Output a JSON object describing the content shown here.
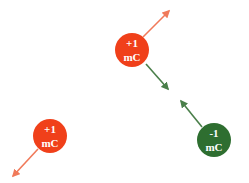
{
  "colors": {
    "positive_fill": "#F0401A",
    "negative_fill": "#2E6E30",
    "positive_arrow": "#F07A5A",
    "negative_arrow": "#4A7F4A",
    "background": "#FFFFFF"
  },
  "charges": [
    {
      "id": "charge-top",
      "sign": "positive",
      "value": "+1",
      "unit": "mC",
      "cx": 132,
      "cy": 50,
      "r": 17
    },
    {
      "id": "charge-bottom-left",
      "sign": "positive",
      "value": "+1",
      "unit": "mC",
      "cx": 50,
      "cy": 136,
      "r": 17
    },
    {
      "id": "charge-bottom-right",
      "sign": "negative",
      "value": "-1",
      "unit": "mC",
      "cx": 214,
      "cy": 140,
      "r": 17
    }
  ],
  "arrows": [
    {
      "id": "force-top-repulsion",
      "color": "positive",
      "x1": 143,
      "y1": 37,
      "x2": 169,
      "y2": 11
    },
    {
      "id": "force-top-attraction",
      "color": "negative",
      "x1": 146,
      "y1": 64,
      "x2": 168,
      "y2": 89
    },
    {
      "id": "force-bottom-right-attraction",
      "color": "negative",
      "x1": 202,
      "y1": 127,
      "x2": 181,
      "y2": 101
    },
    {
      "id": "force-bottom-left-repulsion",
      "color": "positive",
      "x1": 38,
      "y1": 149,
      "x2": 13,
      "y2": 176
    }
  ]
}
